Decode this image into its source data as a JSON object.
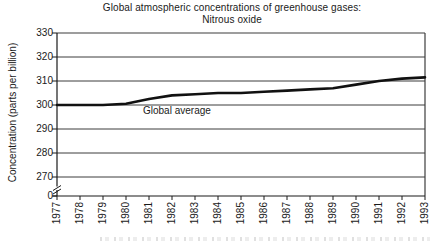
{
  "title": "Global atmospheric concentrations of greenhouse gases:",
  "subtitle": "Nitrous oxide",
  "y_axis_label": "Concentration (parts per billion)",
  "series_label": "Global average",
  "colors": {
    "background": "#ffffff",
    "ink": "#1a1a1a",
    "grid": "#3d3d3d",
    "line": "#111111"
  },
  "chart_data": {
    "type": "line",
    "title": "Global atmospheric concentrations of greenhouse gases: Nitrous oxide",
    "xlabel": "",
    "ylabel": "Concentration (parts per billion)",
    "x": [
      1977,
      1978,
      1979,
      1980,
      1981,
      1982,
      1983,
      1984,
      1985,
      1986,
      1987,
      1988,
      1989,
      1990,
      1991,
      1992,
      1993
    ],
    "series": [
      {
        "name": "Global average",
        "values": [
          300,
          300,
          300,
          300.5,
          302.5,
          304,
          304.5,
          305,
          305,
          305.5,
          306,
          306.5,
          307,
          308.5,
          310,
          311,
          311.5
        ]
      }
    ],
    "y_ticks": [
      330,
      320,
      310,
      300,
      290,
      280,
      270,
      0
    ],
    "ylim_display": [
      270,
      330
    ],
    "axis_break": true,
    "grid": true,
    "legend_position": "inline-label"
  }
}
